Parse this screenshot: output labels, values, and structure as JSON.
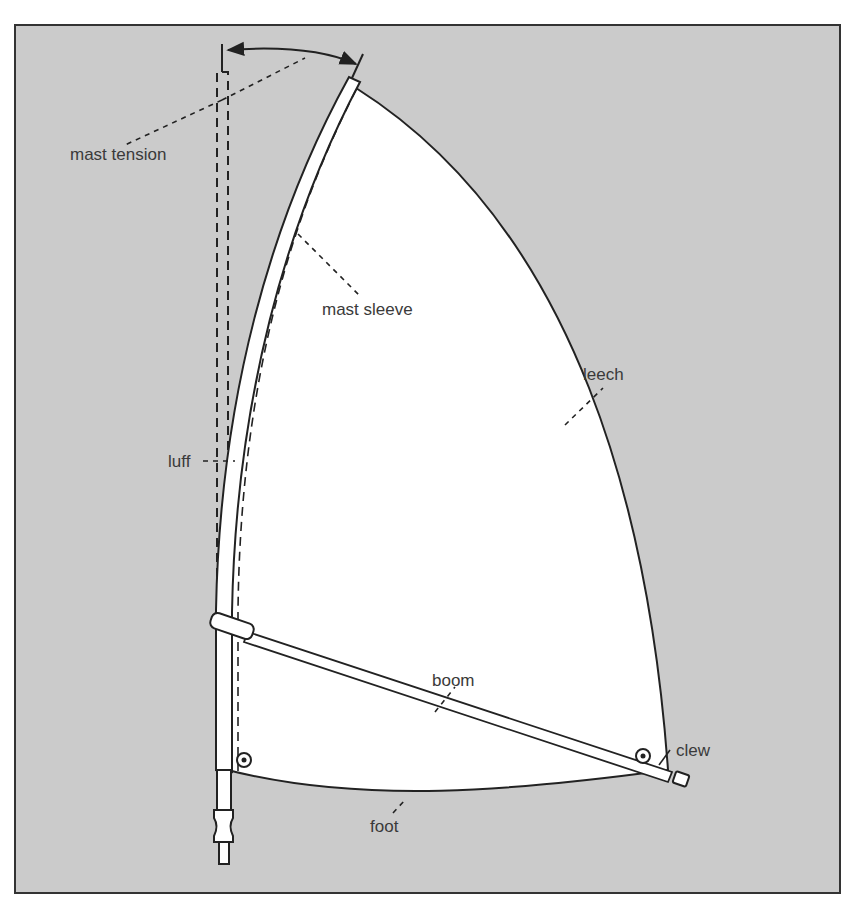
{
  "diagram": {
    "colors": {
      "background": "#cbcbcb",
      "sail": "#ffffff",
      "line": "#222222",
      "text": "#3a3a3a"
    },
    "labels": {
      "mast_tension": "mast tension",
      "mast_sleeve": "mast sleeve",
      "leech": "leech",
      "luff": "luff",
      "boom": "boom",
      "clew": "clew",
      "foot": "foot"
    }
  }
}
